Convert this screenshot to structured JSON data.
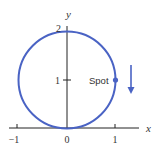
{
  "diagram": {
    "axes": {
      "x_label": "x",
      "y_label": "y",
      "x_ticks": [
        {
          "label": "−1",
          "value": -1
        },
        {
          "label": "0",
          "value": 0
        },
        {
          "label": "1",
          "value": 1
        }
      ],
      "y_ticks": [
        {
          "label": "1",
          "value": 1
        },
        {
          "label": "2",
          "value": 2
        }
      ]
    },
    "circle": {
      "center": [
        0,
        1
      ],
      "radius": 1,
      "color": "#4a63c4"
    },
    "spot": {
      "label": "Spot",
      "position": [
        1,
        1
      ],
      "color": "#4a63c4"
    },
    "arrow": {
      "direction": "down",
      "color": "#4a63c4"
    },
    "colors": {
      "axis": "#222222",
      "text": "#333333"
    }
  }
}
